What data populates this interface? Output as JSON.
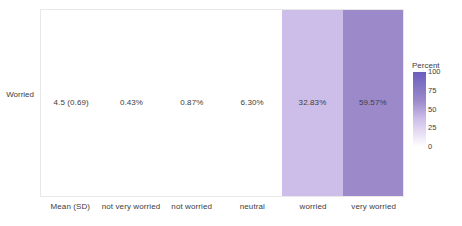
{
  "chart_data": {
    "type": "heatmap",
    "title": "",
    "xlabel": "",
    "ylabel": "",
    "rows": [
      "Worried"
    ],
    "categories": [
      "Mean (SD)",
      "not very worried",
      "not worried",
      "neutral",
      "worried",
      "very worried"
    ],
    "cells": [
      {
        "category": "Mean (SD)",
        "label": "4.5 (0.69)",
        "value": null,
        "fill": "#ffffff"
      },
      {
        "category": "not very worried",
        "label": "0.43%",
        "value": 0.43,
        "fill": "#ffffff"
      },
      {
        "category": "not worried",
        "label": "0.87%",
        "value": 0.87,
        "fill": "#ffffff"
      },
      {
        "category": "neutral",
        "label": "6.30%",
        "value": 6.3,
        "fill": "#ffffff"
      },
      {
        "category": "worried",
        "label": "32.83%",
        "value": 32.83,
        "fill": "#cdbde9"
      },
      {
        "category": "very worried",
        "label": "59.57%",
        "value": 59.57,
        "fill": "#9b89ca"
      }
    ],
    "legend": {
      "title": "Percent",
      "position": "right",
      "ticks": [
        "100",
        "75",
        "50",
        "25",
        "0"
      ],
      "range": [
        0,
        100
      ],
      "gradient_top": "#6a5fbe",
      "gradient_bottom": "#ffffff"
    },
    "colors": {
      "panel_background": "#ffffff",
      "panel_border": "#e8e8e8",
      "text": "#3d3d3d",
      "low": "#ffffff",
      "mid": "#cdbde9",
      "high": "#9b89ca",
      "max": "#6a5fbe"
    },
    "grid": false
  }
}
